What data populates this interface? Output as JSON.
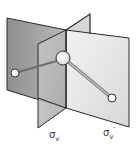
{
  "figure": {
    "labels": {
      "plane1": {
        "symbol": "σ",
        "subscript": "v",
        "prime": ""
      },
      "plane2": {
        "symbol": "σ",
        "subscript": "v",
        "prime": "′"
      }
    },
    "colors": {
      "plane_back": "#9c9c9c",
      "plane_front": "#bdbdbd",
      "plane_right": "#e8e8e8",
      "edge": "#2a2a2a",
      "bond": "#777777",
      "atom_fill": "#ffffff"
    }
  }
}
